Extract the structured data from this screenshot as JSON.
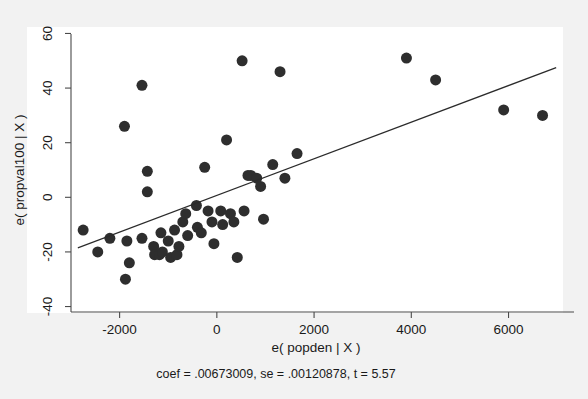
{
  "figure": {
    "background_color": "#f2f2f2",
    "plot_background_color": "#ffffff",
    "point_color": "#2e2e2e",
    "axis_color": "#4a4a4a",
    "line_color": "#2b2b2b"
  },
  "caption": "coef = .00673009, se = .00120878, t = 5.57",
  "chart_data": {
    "type": "scatter",
    "title": "",
    "xlabel": "e( popden | X )",
    "ylabel": "e( propval100 | X )",
    "xlim": [
      -3000,
      7100
    ],
    "ylim": [
      -42,
      62
    ],
    "xticks": [
      -2000,
      0,
      2000,
      4000,
      6000
    ],
    "xtick_labels": [
      "-2000",
      "0",
      "2000",
      "4000",
      "6000"
    ],
    "yticks": [
      -40,
      -20,
      0,
      20,
      40,
      60
    ],
    "ytick_labels": [
      "-40",
      "-20",
      "0",
      "20",
      "40",
      "60"
    ],
    "grid": false,
    "legend": null,
    "marker": "filled-circle",
    "marker_size_px": 11,
    "points": [
      {
        "x": -2750,
        "y": -12
      },
      {
        "x": -2450,
        "y": -20
      },
      {
        "x": -2200,
        "y": -15
      },
      {
        "x": -1850,
        "y": -16
      },
      {
        "x": -1800,
        "y": -24
      },
      {
        "x": -1880,
        "y": -30
      },
      {
        "x": -1540,
        "y": 41
      },
      {
        "x": -1900,
        "y": 26
      },
      {
        "x": -1430,
        "y": 9.5
      },
      {
        "x": -1430,
        "y": 2
      },
      {
        "x": -1540,
        "y": -15
      },
      {
        "x": -1300,
        "y": -18
      },
      {
        "x": -1280,
        "y": -21
      },
      {
        "x": -1180,
        "y": -21
      },
      {
        "x": -1150,
        "y": -13
      },
      {
        "x": -1120,
        "y": -20
      },
      {
        "x": -1000,
        "y": -16
      },
      {
        "x": -950,
        "y": -22
      },
      {
        "x": -870,
        "y": -12
      },
      {
        "x": -820,
        "y": -21
      },
      {
        "x": -780,
        "y": -18
      },
      {
        "x": -700,
        "y": -9
      },
      {
        "x": -640,
        "y": -6
      },
      {
        "x": -600,
        "y": -14
      },
      {
        "x": -420,
        "y": -3
      },
      {
        "x": -400,
        "y": -11
      },
      {
        "x": -320,
        "y": -13
      },
      {
        "x": -250,
        "y": 11
      },
      {
        "x": -180,
        "y": -5
      },
      {
        "x": -100,
        "y": -9
      },
      {
        "x": -60,
        "y": -17
      },
      {
        "x": 80,
        "y": -5
      },
      {
        "x": 120,
        "y": -10
      },
      {
        "x": 200,
        "y": 21
      },
      {
        "x": 280,
        "y": -6
      },
      {
        "x": 350,
        "y": -9
      },
      {
        "x": 420,
        "y": -22
      },
      {
        "x": 520,
        "y": 50
      },
      {
        "x": 560,
        "y": -5
      },
      {
        "x": 640,
        "y": 8
      },
      {
        "x": 700,
        "y": 8
      },
      {
        "x": 820,
        "y": 7
      },
      {
        "x": 900,
        "y": 4
      },
      {
        "x": 960,
        "y": -8
      },
      {
        "x": 1150,
        "y": 12
      },
      {
        "x": 1300,
        "y": 46
      },
      {
        "x": 1400,
        "y": 7
      },
      {
        "x": 1650,
        "y": 16
      },
      {
        "x": 3900,
        "y": 51
      },
      {
        "x": 4500,
        "y": 43
      },
      {
        "x": 5900,
        "y": 32
      },
      {
        "x": 6700,
        "y": 30
      }
    ],
    "fit_line": {
      "label": "linear fit",
      "slope": 0.00673009,
      "se": 0.00120878,
      "t": 5.57,
      "x_start": -2860,
      "y_start": -18.5,
      "x_end": 6980,
      "y_end": 47.5
    }
  }
}
